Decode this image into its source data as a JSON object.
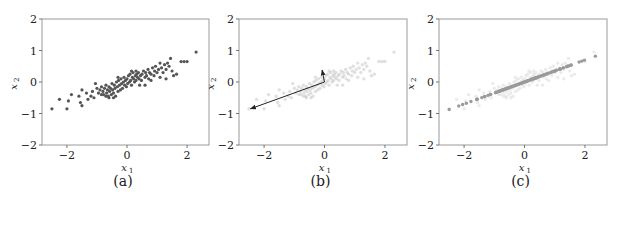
{
  "chart_data": [
    {
      "id": "a",
      "type": "scatter",
      "caption": "(a)",
      "xlabel": "x",
      "xlabel_sub": "1",
      "ylabel": "x",
      "ylabel_sub": "2",
      "xlim": [
        -2.83,
        2.73
      ],
      "ylim": [
        -2,
        2
      ],
      "xticks": [
        -2,
        0,
        2
      ],
      "yticks": [
        -2,
        -1,
        0,
        1,
        2
      ],
      "xtick_labels": [
        "−2",
        "0",
        "2"
      ],
      "ytick_labels": [
        "−2",
        "−1",
        "0",
        "1",
        "2"
      ],
      "grid": false,
      "description": "Original correlated 2D data points",
      "point_color": "#555555",
      "point_opacity": 1.0,
      "points": [
        [
          -2.5,
          -0.85
        ],
        [
          -2.25,
          -0.55
        ],
        [
          -2.0,
          -0.85
        ],
        [
          -1.95,
          -0.6
        ],
        [
          -1.85,
          -0.4
        ],
        [
          -1.5,
          -0.25
        ],
        [
          -1.55,
          -0.65
        ],
        [
          -1.5,
          -0.75
        ],
        [
          -1.35,
          -0.35
        ],
        [
          -1.3,
          -0.55
        ],
        [
          -1.2,
          -0.45
        ],
        [
          -1.15,
          -0.3
        ],
        [
          -1.1,
          -0.5
        ],
        [
          -1.0,
          -0.2
        ],
        [
          -0.95,
          -0.35
        ],
        [
          -0.9,
          -0.25
        ],
        [
          -0.85,
          -0.15
        ],
        [
          -0.8,
          -0.3
        ],
        [
          -0.78,
          -0.4
        ],
        [
          -0.75,
          -0.2
        ],
        [
          -0.7,
          -0.1
        ],
        [
          -0.68,
          -0.35
        ],
        [
          -0.65,
          -0.25
        ],
        [
          -0.62,
          -0.45
        ],
        [
          -0.6,
          -0.15
        ],
        [
          -0.58,
          -0.3
        ],
        [
          -0.55,
          -0.2
        ],
        [
          -0.52,
          -0.4
        ],
        [
          -0.5,
          -0.05
        ],
        [
          -0.48,
          -0.25
        ],
        [
          -0.45,
          -0.35
        ],
        [
          -0.42,
          -0.1
        ],
        [
          -0.4,
          -0.2
        ],
        [
          -0.38,
          -0.45
        ],
        [
          -0.35,
          0.0
        ],
        [
          -0.32,
          -0.15
        ],
        [
          -0.3,
          -0.3
        ],
        [
          -0.28,
          0.05
        ],
        [
          -0.25,
          -0.1
        ],
        [
          -0.22,
          -0.25
        ],
        [
          -0.2,
          0.1
        ],
        [
          -0.18,
          -0.05
        ],
        [
          -0.15,
          -0.2
        ],
        [
          -0.12,
          0.0
        ],
        [
          -0.1,
          0.15
        ],
        [
          -0.08,
          -0.1
        ],
        [
          -0.05,
          0.05
        ],
        [
          -0.02,
          -0.15
        ],
        [
          0.0,
          0.1
        ],
        [
          0.02,
          -0.05
        ],
        [
          0.05,
          0.2
        ],
        [
          0.08,
          0.0
        ],
        [
          0.1,
          0.25
        ],
        [
          0.12,
          0.05
        ],
        [
          0.15,
          -0.1
        ],
        [
          0.18,
          0.15
        ],
        [
          0.2,
          0.3
        ],
        [
          0.22,
          0.1
        ],
        [
          0.25,
          0.0
        ],
        [
          0.28,
          0.2
        ],
        [
          0.3,
          0.05
        ],
        [
          0.32,
          0.25
        ],
        [
          0.35,
          0.15
        ],
        [
          0.38,
          0.3
        ],
        [
          0.4,
          0.1
        ],
        [
          0.42,
          -0.1
        ],
        [
          0.45,
          0.2
        ],
        [
          0.48,
          0.05
        ],
        [
          0.5,
          0.25
        ],
        [
          0.55,
          0.35
        ],
        [
          0.6,
          0.15
        ],
        [
          0.62,
          0.3
        ],
        [
          0.65,
          0.2
        ],
        [
          0.7,
          0.4
        ],
        [
          0.72,
          0.1
        ],
        [
          0.75,
          0.3
        ],
        [
          0.8,
          0.25
        ],
        [
          0.85,
          0.45
        ],
        [
          0.9,
          0.2
        ],
        [
          0.92,
          0.35
        ],
        [
          0.95,
          0.5
        ],
        [
          1.0,
          0.3
        ],
        [
          1.05,
          0.4
        ],
        [
          1.1,
          0.15
        ],
        [
          1.15,
          0.45
        ],
        [
          1.2,
          0.3
        ],
        [
          1.25,
          0.55
        ],
        [
          1.3,
          0.4
        ],
        [
          1.35,
          0.6
        ],
        [
          1.4,
          0.5
        ],
        [
          1.45,
          0.75
        ],
        [
          1.5,
          0.35
        ],
        [
          1.55,
          0.2
        ],
        [
          1.65,
          0.25
        ],
        [
          1.8,
          0.65
        ],
        [
          1.9,
          0.65
        ],
        [
          2.0,
          0.65
        ],
        [
          2.3,
          0.95
        ],
        [
          -0.7,
          -0.45
        ],
        [
          -0.6,
          -0.5
        ],
        [
          -0.45,
          -0.5
        ],
        [
          0.6,
          -0.1
        ],
        [
          0.3,
          0.35
        ],
        [
          0.15,
          0.35
        ],
        [
          -0.3,
          0.15
        ],
        [
          -0.85,
          -0.4
        ],
        [
          1.1,
          0.6
        ],
        [
          1.3,
          0.1
        ],
        [
          0.8,
          0.05
        ],
        [
          -1.6,
          -0.45
        ],
        [
          -1.05,
          -0.05
        ]
      ]
    },
    {
      "id": "b",
      "type": "scatter",
      "caption": "(b)",
      "xlabel": "x",
      "xlabel_sub": "1",
      "ylabel": "x",
      "ylabel_sub": "2",
      "xlim": [
        -2.83,
        2.73
      ],
      "ylim": [
        -2,
        2
      ],
      "xticks": [
        -2,
        0,
        2
      ],
      "yticks": [
        -2,
        -1,
        0,
        1,
        2
      ],
      "xtick_labels": [
        "−2",
        "0",
        "2"
      ],
      "ytick_labels": [
        "−2",
        "−1",
        "0",
        "1",
        "2"
      ],
      "grid": false,
      "description": "Faded data with principal component direction arrows from the mean",
      "point_color": "#bbbbbb",
      "point_opacity": 0.45,
      "arrows": [
        {
          "from": [
            0.0,
            0.0
          ],
          "to": [
            -2.45,
            -0.85
          ],
          "color": "#222222",
          "label": "principal component 1"
        },
        {
          "from": [
            0.0,
            0.0
          ],
          "to": [
            -0.08,
            0.38
          ],
          "color": "#222222",
          "label": "principal component 2"
        }
      ]
    },
    {
      "id": "c",
      "type": "scatter",
      "caption": "(c)",
      "xlabel": "x",
      "xlabel_sub": "1",
      "ylabel": "x",
      "ylabel_sub": "2",
      "xlim": [
        -2.83,
        2.73
      ],
      "ylim": [
        -2,
        2
      ],
      "xticks": [
        -2,
        0,
        2
      ],
      "yticks": [
        -2,
        -1,
        0,
        1,
        2
      ],
      "xtick_labels": [
        "−2",
        "0",
        "2"
      ],
      "ytick_labels": [
        "−2",
        "−1",
        "0",
        "1",
        "2"
      ],
      "grid": false,
      "description": "Faded original data plus points projected onto the first principal component line",
      "point_color": "#dddddd",
      "projected_color": "#9a9a9a",
      "projection_slope": 0.35
    }
  ]
}
